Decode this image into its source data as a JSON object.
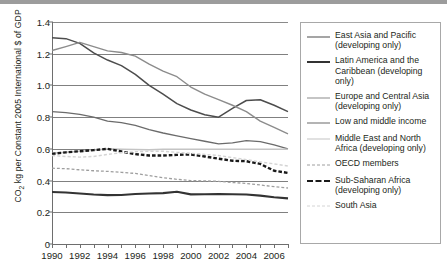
{
  "chart_data": {
    "type": "line",
    "title": "",
    "xlabel": "",
    "ylabel": "CO2 kg per Constant 2005 International $ of GDP",
    "ylabel_parts": {
      "pre": "CO",
      "sub": "2",
      "post": " kg per Constant 2005 International $ of GDP"
    },
    "xlim": [
      1990,
      2007
    ],
    "ylim": [
      0,
      1.4
    ],
    "yticks": [
      "0",
      "0.2",
      "0.4",
      "0.6",
      "0.8",
      "1.0",
      "1.2",
      "1.4"
    ],
    "ytick_values": [
      0,
      0.2,
      0.4,
      0.6,
      0.8,
      1.0,
      1.2,
      1.4
    ],
    "xticks_all": [
      1990,
      1991,
      1992,
      1993,
      1994,
      1995,
      1996,
      1997,
      1998,
      1999,
      2000,
      2001,
      2002,
      2003,
      2004,
      2005,
      2006,
      2007
    ],
    "xtick_labels": [
      "1990",
      "1992",
      "1994",
      "1996",
      "1998",
      "2000",
      "2002",
      "2004",
      "2006"
    ],
    "xtick_label_values": [
      1990,
      1992,
      1994,
      1996,
      1998,
      2000,
      2002,
      2004,
      2006
    ],
    "grid": true,
    "grid_axis": "y",
    "legend_position": "right",
    "x": [
      1990,
      1991,
      1992,
      1993,
      1994,
      1995,
      1996,
      1997,
      1998,
      1999,
      2000,
      2001,
      2002,
      2003,
      2004,
      2005,
      2006,
      2007
    ],
    "series": [
      {
        "name": "East Asia and Pacific (developing only)",
        "color": "#4d4d4d",
        "width": 1.5,
        "dash": "none",
        "values": [
          1.3,
          1.295,
          1.265,
          1.205,
          1.16,
          1.125,
          1.07,
          1.0,
          0.945,
          0.885,
          0.845,
          0.815,
          0.8,
          0.855,
          0.905,
          0.91,
          0.875,
          0.835
        ]
      },
      {
        "name": "Latin America and the Caribbean (developing only)",
        "color": "#333333",
        "width": 2.1,
        "dash": "none",
        "values": [
          0.328,
          0.325,
          0.318,
          0.312,
          0.308,
          0.309,
          0.315,
          0.318,
          0.321,
          0.33,
          0.313,
          0.314,
          0.315,
          0.314,
          0.312,
          0.305,
          0.295,
          0.288
        ]
      },
      {
        "name": "Europe and Central Asia (developing only)",
        "color": "#8c8c8c",
        "width": 1.4,
        "dash": "none",
        "values": [
          1.22,
          1.245,
          1.272,
          1.245,
          1.218,
          1.208,
          1.185,
          1.135,
          1.09,
          1.055,
          0.99,
          0.945,
          0.91,
          0.875,
          0.835,
          0.775,
          0.735,
          0.695
        ]
      },
      {
        "name": "Low and middle income",
        "color": "#6b6b6b",
        "width": 1.3,
        "dash": "none",
        "values": [
          0.835,
          0.828,
          0.818,
          0.8,
          0.775,
          0.765,
          0.748,
          0.722,
          0.7,
          0.682,
          0.665,
          0.648,
          0.632,
          0.638,
          0.652,
          0.645,
          0.625,
          0.6
        ]
      },
      {
        "name": "Middle East and North Africa (developing only)",
        "color": "#c4c4c4",
        "width": 1.5,
        "dash": "none",
        "values": [
          0.572,
          0.578,
          0.585,
          0.592,
          0.6,
          0.598,
          0.596,
          0.595,
          0.597,
          0.598,
          0.598,
          0.598,
          0.598,
          0.598,
          0.598,
          0.598,
          0.598,
          0.598
        ]
      },
      {
        "name": "OECD members",
        "color": "#9e9e9e",
        "width": 1.3,
        "dash": "dashed",
        "values": [
          0.478,
          0.475,
          0.468,
          0.462,
          0.458,
          0.452,
          0.445,
          0.432,
          0.418,
          0.408,
          0.4,
          0.398,
          0.395,
          0.388,
          0.382,
          0.372,
          0.362,
          0.353
        ]
      },
      {
        "name": "Sub-Saharan Africa (developing only)",
        "color": "#1a1a1a",
        "width": 2.4,
        "dash": "bold-dashed",
        "values": [
          0.568,
          0.578,
          0.585,
          0.592,
          0.6,
          0.583,
          0.567,
          0.558,
          0.558,
          0.562,
          0.565,
          0.552,
          0.538,
          0.525,
          0.522,
          0.505,
          0.462,
          0.448
        ]
      },
      {
        "name": "South Asia",
        "color": "#d4d4d4",
        "width": 1.4,
        "dash": "dashed",
        "values": [
          0.558,
          0.552,
          0.548,
          0.552,
          0.565,
          0.575,
          0.582,
          0.585,
          0.585,
          0.578,
          0.572,
          0.565,
          0.558,
          0.545,
          0.532,
          0.518,
          0.505,
          0.492
        ]
      }
    ]
  },
  "legend": {
    "items": [
      {
        "label": "East Asia and Pacific (developing only)"
      },
      {
        "label": "Latin America and the Caribbean (developing only)"
      },
      {
        "label": "Europe and Central Asia (developing only)"
      },
      {
        "label": "Low and middle income"
      },
      {
        "label": "Middle East and North Africa (developing only)"
      },
      {
        "label": "OECD members"
      },
      {
        "label": "Sub-Saharan Africa (developing only)"
      },
      {
        "label": "South Asia"
      }
    ]
  }
}
